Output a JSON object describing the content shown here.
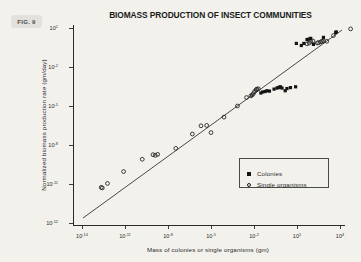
{
  "figure": {
    "badge_label": "FIG. 9",
    "background_color": "#f2f1ec",
    "ink_color": "#1d1d1d"
  },
  "legend": {
    "position": "inside lower-right",
    "entries": [
      {
        "marker": "filled-square",
        "label": "Colonies"
      },
      {
        "marker": "open-circle",
        "label": "Single organisms"
      }
    ]
  },
  "axes": {
    "x_tick_labels": [
      "10-14",
      "10-11",
      "10-8",
      "10-5",
      "10-2",
      "101",
      "104"
    ],
    "y_tick_labels": [
      "101",
      "10-2",
      "10-5",
      "10-8",
      "10-11",
      "10-12"
    ]
  },
  "chart_data": {
    "type": "scatter",
    "title": "BIOMASS PRODUCTION OF INSECT COMMUNITIES",
    "xlabel": "Mass of colonies or single organisms (gm)",
    "ylabel": "Normalized biomass production rate (gm/day)",
    "xscale": "log",
    "yscale": "log",
    "xlim": [
      1e-14,
      100000.0
    ],
    "ylim": [
      1e-12,
      10.0
    ],
    "grid": false,
    "legend_position": "lower right inside axes",
    "x_ticks": [
      1e-14,
      1e-11,
      1e-08,
      1e-05,
      0.01,
      10.0,
      10000.0
    ],
    "x_ticks_text": [
      "10^-14",
      "10^-11",
      "10^-8",
      "10^-5",
      "10^-2",
      "10^1",
      "10^4"
    ],
    "y_ticks": [
      10.0,
      0.01,
      1e-05,
      1e-08,
      1e-11
    ],
    "y_ticks_text": [
      "10^1",
      "10^-2",
      "10^-5",
      "10^-8",
      "10^-11"
    ],
    "y_ticks_extra_text": "10^-12",
    "fit_line": {
      "label": "regression line",
      "description": "straight line on log-log axes through all data",
      "x_start": 2e-13,
      "y_start": 6e-12,
      "x_end": 60000.0,
      "y_end": 8.0,
      "log_slope": 0.63
    },
    "series": [
      {
        "name": "Single organisms",
        "marker": "open-circle",
        "points": [
          [
            2.2e-13,
            5.5e-12
          ],
          [
            2.6e-13,
            5e-12
          ],
          [
            6e-13,
            1.1e-11
          ],
          [
            8e-12,
            9e-11
          ],
          [
            1.6e-10,
            8e-10
          ],
          [
            9e-10,
            1.8e-09
          ],
          [
            1.3e-09,
            1.6e-09
          ],
          [
            1.9e-09,
            1.9e-09
          ],
          [
            3.5e-08,
            5.5e-09
          ],
          [
            5e-07,
            7e-08
          ],
          [
            1e-05,
            9e-08
          ],
          [
            2e-06,
            3e-07
          ],
          [
            5e-06,
            3.2e-07
          ],
          [
            8e-05,
            1.4e-06
          ],
          [
            0.0007,
            1e-05
          ],
          [
            0.003,
            4.5e-05
          ],
          [
            0.006,
            6e-05
          ],
          [
            0.0075,
            7e-05
          ],
          [
            0.009,
            9e-05
          ],
          [
            0.011,
            0.00013
          ],
          [
            0.014,
            0.00018
          ],
          [
            0.016,
            0.0002
          ],
          [
            0.02,
            0.00021
          ],
          [
            50.0,
            0.6
          ],
          [
            70.0,
            0.7
          ],
          [
            90.0,
            0.95
          ],
          [
            130.0,
            1.0
          ],
          [
            260.0,
            0.7
          ],
          [
            320.0,
            0.75
          ],
          [
            450.0,
            0.85
          ],
          [
            550.0,
            0.95
          ],
          [
            700.0,
            1.0
          ],
          [
            1200.0,
            0.95
          ],
          [
            3500.0,
            2.6
          ],
          [
            55000.0,
            8.5
          ]
        ]
      },
      {
        "name": "Colonies",
        "marker": "filled-square",
        "points": [
          [
            0.03,
            0.0001
          ],
          [
            0.04,
            0.00012
          ],
          [
            0.06,
            0.00013
          ],
          [
            0.08,
            0.00015
          ],
          [
            0.12,
            0.00014
          ],
          [
            0.25,
            0.0002
          ],
          [
            0.4,
            0.00024
          ],
          [
            0.5,
            0.00026
          ],
          [
            0.6,
            0.00028
          ],
          [
            0.7,
            0.0003
          ],
          [
            0.9,
            0.00024
          ],
          [
            1.5,
            0.00015
          ],
          [
            2.0,
            0.00022
          ],
          [
            3.5,
            0.00026
          ],
          [
            8.0,
            0.0003
          ],
          [
            9.0,
            0.65
          ],
          [
            20.0,
            0.45
          ],
          [
            30.0,
            0.65
          ],
          [
            50.0,
            1.3
          ],
          [
            70.0,
            1.4
          ],
          [
            90.0,
            1.6
          ],
          [
            140.0,
            0.55
          ],
          [
            700.0,
            1.9
          ],
          [
            5000.0,
            4.5
          ],
          [
            5500.0,
            5.0
          ]
        ]
      }
    ]
  }
}
